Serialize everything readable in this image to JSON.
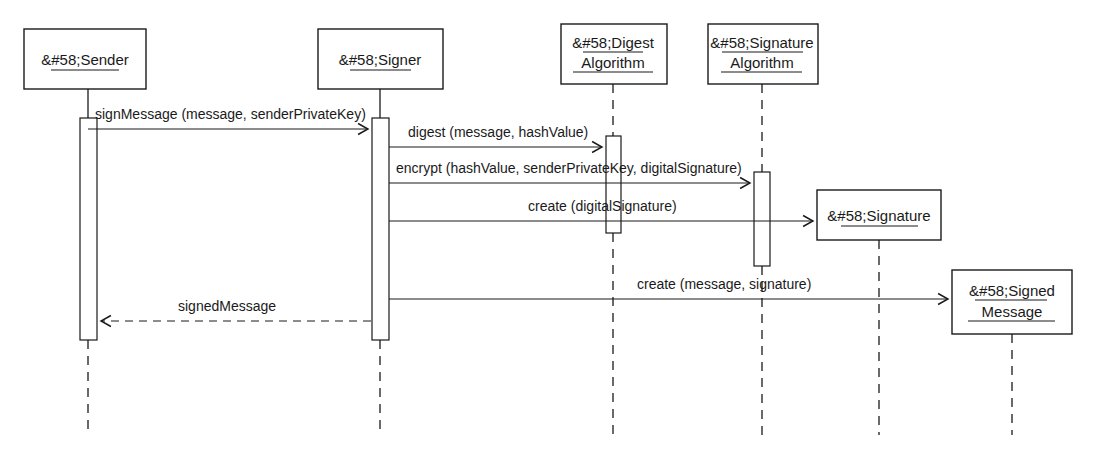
{
  "diagram": {
    "type": "uml-sequence-diagram",
    "title": "",
    "canvas": {
      "width": 1100,
      "height": 469
    },
    "colors": {
      "stroke": "#1a1a1a",
      "background": "#ffffff"
    }
  },
  "lifelines": [
    {
      "id": "sender",
      "label_lines": [
        "&#58;Sender"
      ],
      "box": {
        "x": 24,
        "y": 29,
        "w": 122,
        "h": 60
      },
      "axis_x": 88,
      "lifeline_bottom": 435
    },
    {
      "id": "signer",
      "label_lines": [
        "&#58;Signer"
      ],
      "box": {
        "x": 318,
        "y": 29,
        "w": 125,
        "h": 60
      },
      "axis_x": 380,
      "lifeline_bottom": 435
    },
    {
      "id": "digest-algorithm",
      "label_lines": [
        "&#58;Digest",
        "Algorithm"
      ],
      "box": {
        "x": 561,
        "y": 24,
        "w": 106,
        "h": 60
      },
      "axis_x": 613,
      "lifeline_bottom": 435
    },
    {
      "id": "signature-algorithm",
      "label_lines": [
        "&#58;Signature",
        "Algorithm"
      ],
      "box": {
        "x": 708,
        "y": 24,
        "w": 110,
        "h": 60
      },
      "axis_x": 762,
      "lifeline_bottom": 435
    },
    {
      "id": "signature",
      "label_lines": [
        "&#58;Signature"
      ],
      "box": {
        "x": 817,
        "y": 190,
        "w": 124,
        "h": 50
      },
      "axis_x": 879,
      "lifeline_bottom": 435
    },
    {
      "id": "signed-message",
      "label_lines": [
        "&#58;Signed",
        "Message"
      ],
      "box": {
        "x": 952,
        "y": 270,
        "w": 120,
        "h": 64
      },
      "axis_x": 1012,
      "lifeline_bottom": 435
    }
  ],
  "activations": [
    {
      "id": "sender-activation",
      "owner": "sender",
      "x": 80,
      "y": 118,
      "w": 17,
      "h": 222
    },
    {
      "id": "signer-activation",
      "owner": "signer",
      "x": 372,
      "y": 118,
      "w": 17,
      "h": 222
    },
    {
      "id": "digest-activation",
      "owner": "digest-algorithm",
      "x": 606,
      "y": 136,
      "w": 15,
      "h": 97
    },
    {
      "id": "signature-algorithm-activation",
      "owner": "signature-algorithm",
      "x": 754,
      "y": 172,
      "w": 16,
      "h": 94
    }
  ],
  "messages": [
    {
      "id": "sign-message",
      "label": "signMessage (message, senderPrivateKey)",
      "from": "sender",
      "to": "signer",
      "x1": 88,
      "x2": 370,
      "y": 129,
      "label_x": 95,
      "label_y": 119,
      "style": "solid",
      "direction": "right"
    },
    {
      "id": "digest",
      "label": "digest (message, hashValue)",
      "from": "signer",
      "to": "digest-algorithm",
      "x1": 389,
      "x2": 604,
      "y": 147,
      "label_x": 408,
      "label_y": 137,
      "style": "solid",
      "direction": "right"
    },
    {
      "id": "encrypt",
      "label": "encrypt (hashValue, senderPrivateKey, digitalSignature)",
      "from": "signer",
      "to": "signature-algorithm",
      "x1": 389,
      "x2": 752,
      "y": 183,
      "label_x": 396,
      "label_y": 173,
      "style": "solid",
      "direction": "right"
    },
    {
      "id": "create-digital-signature",
      "label": "create (digitalSignature)",
      "from": "signer",
      "to": "signature",
      "x1": 389,
      "x2": 815,
      "y": 221,
      "label_x": 528,
      "label_y": 211,
      "style": "solid",
      "direction": "right"
    },
    {
      "id": "create-signed-message",
      "label": "create (message, signature)",
      "from": "signer",
      "to": "signed-message",
      "x1": 389,
      "x2": 950,
      "y": 299,
      "label_x": 637,
      "label_y": 289,
      "style": "solid",
      "direction": "right"
    },
    {
      "id": "signed-message-return",
      "label": "signedMessage",
      "from": "signer",
      "to": "sender",
      "x1": 371,
      "x2": 99,
      "y": 321,
      "label_x": 178,
      "label_y": 311,
      "style": "dashed",
      "direction": "left"
    }
  ]
}
